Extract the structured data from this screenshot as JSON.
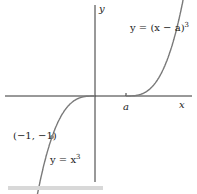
{
  "figure": {
    "axis_labels": {
      "x": "x",
      "y": "y"
    },
    "tick_label_a": "a",
    "curve1_label": "y = x",
    "curve1_exp": "3",
    "curve2_label": "y = (x − a)",
    "curve2_exp": "3",
    "point_label": "(−1, −1)",
    "a_value": 0.72,
    "point": [
      -1,
      -1
    ],
    "colors": {
      "curve": "#7a7a7a",
      "axis": "#333333",
      "point": "#8a8a8a"
    }
  }
}
